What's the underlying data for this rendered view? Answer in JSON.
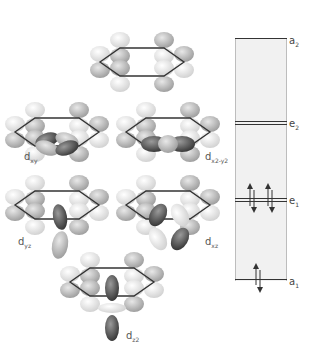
{
  "orbitals": [
    {
      "id": "top",
      "label": ""
    },
    {
      "id": "dxy",
      "label_main": "d",
      "label_sub": "xy"
    },
    {
      "id": "dx2y2",
      "label_main": "d",
      "label_sub": "x2-y2"
    },
    {
      "id": "dyz",
      "label_main": "d",
      "label_sub": "yz"
    },
    {
      "id": "dxz",
      "label_main": "d",
      "label_sub": "xz"
    },
    {
      "id": "dz2",
      "label_main": "d",
      "label_sub": "z2"
    }
  ],
  "energy_diagram": {
    "levels": [
      {
        "symbol": "a",
        "sub": "2",
        "electrons": 0
      },
      {
        "symbol": "e",
        "sub": "2",
        "electrons": 0
      },
      {
        "symbol": "e",
        "sub": "1",
        "electrons": 4
      },
      {
        "symbol": "a",
        "sub": "1",
        "electrons": 2
      }
    ]
  },
  "colors": {
    "lobe_light": "#e6e6e6",
    "lobe_mid": "#b5b5b5",
    "lobe_dark": "#555555",
    "ring": "#333333",
    "box_fill": "#f1f1f1"
  }
}
